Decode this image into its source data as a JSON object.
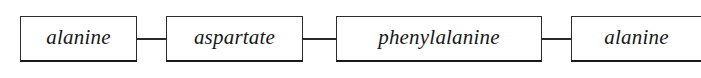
{
  "diagram": {
    "type": "peptide-chain",
    "orientation": "horizontal",
    "background_color": "#ffffff",
    "border_color": "#2b2b2b",
    "text_color": "#181818",
    "nodes": [
      {
        "label": "alanine"
      },
      {
        "label": "aspartate"
      },
      {
        "label": "phenylalanine"
      },
      {
        "label": "alanine"
      }
    ],
    "connectors": [
      {
        "from": "alanine",
        "to": "aspartate"
      },
      {
        "from": "aspartate",
        "to": "phenylalanine"
      },
      {
        "from": "phenylalanine",
        "to": "alanine"
      }
    ]
  }
}
